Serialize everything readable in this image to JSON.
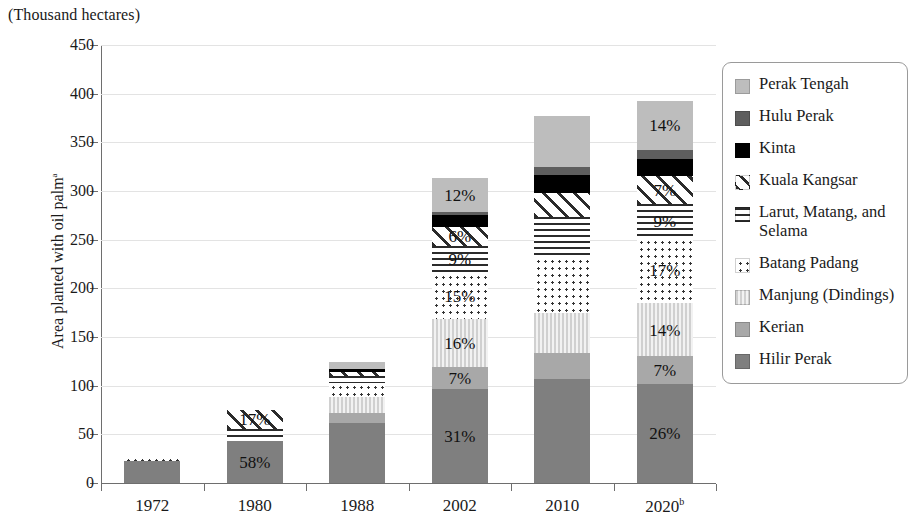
{
  "axis_title": "(Thousand hectares)",
  "ylabel": "Area planted with oil palm",
  "ylabel_superscript": "a",
  "legend": {
    "items": [
      {
        "label": "Perak Tengah",
        "fill": "light"
      },
      {
        "label": "Hulu Perak",
        "fill": "darkgray"
      },
      {
        "label": "Kinta",
        "fill": "black"
      },
      {
        "label": "Kuala Kangsar",
        "fill": "diag"
      },
      {
        "label": "Larut, Matang, and Selama",
        "fill": "hstripe"
      },
      {
        "label": "Batang Padang",
        "fill": "dots"
      },
      {
        "label": "Manjung (Dindings)",
        "fill": "vstripe"
      },
      {
        "label": "Kerian",
        "fill": "solid-mid"
      },
      {
        "label": "Hilir Perak",
        "fill": "solid-dark"
      }
    ]
  },
  "chart_data": {
    "type": "bar",
    "stacked": true,
    "title": "(Thousand hectares)",
    "xlabel": "",
    "ylabel": "Area planted with oil palm",
    "ylim": [
      0,
      450
    ],
    "ytick_labels": [
      "0",
      "50",
      "100",
      "150",
      "200",
      "250",
      "300",
      "350",
      "400",
      "450"
    ],
    "yticks": [
      0,
      50,
      100,
      150,
      200,
      250,
      300,
      350,
      400,
      450
    ],
    "grid": true,
    "legend_position": "right",
    "categories": [
      "1972",
      "1980",
      "1988",
      "2002",
      "2010",
      "2020"
    ],
    "category_labels": [
      "1972",
      "1980",
      "1988",
      "2002",
      "2010",
      "2020ᵇ"
    ],
    "category_superscripts": [
      "",
      "",
      "",
      "",
      "",
      "b"
    ],
    "totals": [
      28,
      75,
      124,
      313,
      377,
      393
    ],
    "series": [
      {
        "name": "Hilir Perak",
        "fill": "solid-dark",
        "values": [
          23,
          43.5,
          62,
          97,
          107,
          102
        ]
      },
      {
        "name": "Kerian",
        "fill": "solid-mid",
        "values": [
          0,
          0,
          10,
          22,
          27,
          28
        ]
      },
      {
        "name": "Manjung (Dindings)",
        "fill": "vstripe",
        "values": [
          0,
          0,
          16,
          50,
          41,
          55
        ]
      },
      {
        "name": "Batang Padang",
        "fill": "dots",
        "values": [
          5,
          0,
          15,
          47,
          57,
          67
        ]
      },
      {
        "name": "Larut, Matang, and Selama",
        "fill": "hstripe",
        "values": [
          0,
          12.5,
          7,
          28,
          41,
          35
        ]
      },
      {
        "name": "Kuala Kangsar",
        "fill": "diag",
        "values": [
          0,
          19,
          4,
          19,
          25,
          28
        ]
      },
      {
        "name": "Kinta",
        "fill": "black",
        "values": [
          0,
          0,
          3,
          12,
          18,
          18
        ]
      },
      {
        "name": "Hulu Perak",
        "fill": "darkgray",
        "values": [
          0,
          0,
          0,
          3,
          9,
          9
        ]
      },
      {
        "name": "Perak Tengah",
        "fill": "light",
        "values": [
          0,
          0,
          7,
          35,
          52,
          51
        ]
      }
    ],
    "data_labels": [
      {
        "category": "1980",
        "series": "Hilir Perak",
        "text": "58%"
      },
      {
        "category": "1980",
        "series": "Kuala Kangsar",
        "text": "17%"
      },
      {
        "category": "2002",
        "series": "Hilir Perak",
        "text": "31%"
      },
      {
        "category": "2002",
        "series": "Kerian",
        "text": "7%"
      },
      {
        "category": "2002",
        "series": "Manjung (Dindings)",
        "text": "16%"
      },
      {
        "category": "2002",
        "series": "Batang Padang",
        "text": "15%"
      },
      {
        "category": "2002",
        "series": "Larut, Matang, and Selama",
        "text": "9%"
      },
      {
        "category": "2002",
        "series": "Kuala Kangsar",
        "text": "6%"
      },
      {
        "category": "2002",
        "series": "Perak Tengah",
        "text": "12%"
      },
      {
        "category": "2020",
        "series": "Hilir Perak",
        "text": "26%"
      },
      {
        "category": "2020",
        "series": "Kerian",
        "text": "7%"
      },
      {
        "category": "2020",
        "series": "Manjung (Dindings)",
        "text": "14%"
      },
      {
        "category": "2020",
        "series": "Batang Padang",
        "text": "17%"
      },
      {
        "category": "2020",
        "series": "Larut, Matang, and Selama",
        "text": "9%"
      },
      {
        "category": "2020",
        "series": "Kuala Kangsar",
        "text": "7%"
      },
      {
        "category": "2020",
        "series": "Perak Tengah",
        "text": "14%"
      }
    ]
  }
}
